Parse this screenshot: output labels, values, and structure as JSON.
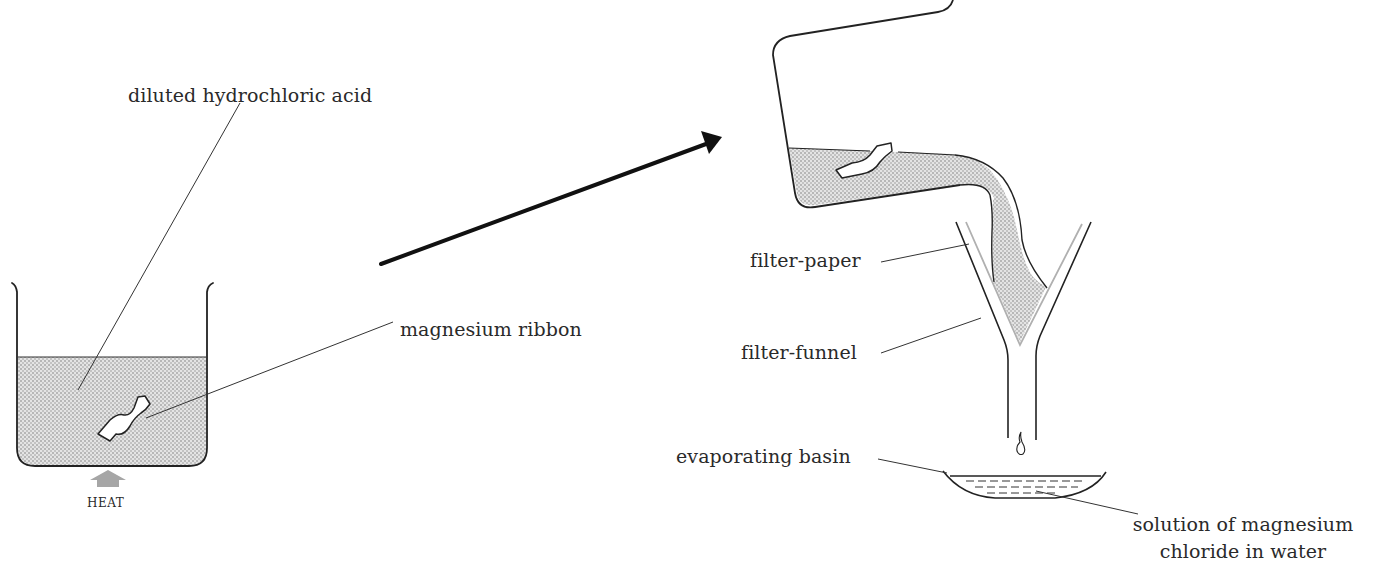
{
  "diagram": {
    "title": "",
    "type": "apparatus-process",
    "stages": [
      {
        "id": "reaction",
        "description": "beaker of acid with magnesium ribbon, heated"
      },
      {
        "id": "filtration",
        "description": "pouring through filter funnel into evaporating basin"
      }
    ],
    "labels": {
      "acid": "diluted hydrochloric acid",
      "ribbon": "magnesium ribbon",
      "heat": "HEAT",
      "filter_paper": "filter-paper",
      "filter_funnel": "filter-funnel",
      "basin": "evaporating basin",
      "solution_line1": "solution of magnesium",
      "solution_line2": "chloride in water"
    },
    "colors": {
      "ink": "#222222",
      "liquid_fill": "#d9d9d9",
      "liquid_dots": "#8a8a8a",
      "heat_arrow": "#a6a6a6",
      "filter_paper_line": "#b0b0b0"
    },
    "edges": [
      {
        "from": "reaction",
        "to": "filtration",
        "style": "bold-arrow"
      }
    ]
  }
}
